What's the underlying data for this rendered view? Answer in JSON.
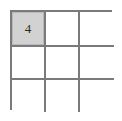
{
  "figure": {
    "type": "grid-puzzle",
    "title": "",
    "background_color": "#ffffff",
    "grid": {
      "rows": 3,
      "columns": 3,
      "line_color": "#7a7a7a",
      "line_width_px": 2,
      "cell_background": "#ffffff",
      "highlight_color": "#d2d2d2",
      "text_color": "#2b2b2b",
      "cells": [
        [
          {
            "value": "4",
            "filled": true
          },
          {
            "value": "",
            "filled": false
          },
          {
            "value": "",
            "filled": false
          }
        ],
        [
          {
            "value": "",
            "filled": false
          },
          {
            "value": "",
            "filled": false
          },
          {
            "value": "",
            "filled": false
          }
        ],
        [
          {
            "value": "",
            "filled": false
          },
          {
            "value": "",
            "filled": false
          },
          {
            "value": "",
            "filled": false
          }
        ]
      ]
    }
  }
}
